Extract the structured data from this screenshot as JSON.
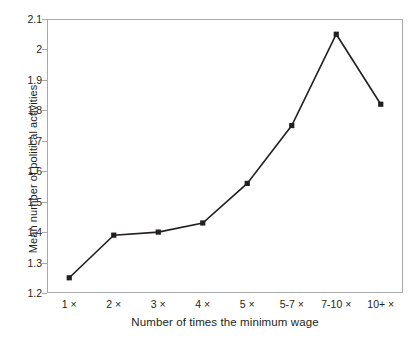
{
  "chart_data": {
    "type": "line",
    "title": "",
    "xlabel": "Number of times the minimum wage",
    "ylabel": "Mean number of political activities",
    "categories": [
      "1 ×",
      "2 ×",
      "3 ×",
      "4 ×",
      "5 ×",
      "5-7 ×",
      "7-10 ×",
      "10+ ×"
    ],
    "values": [
      1.25,
      1.39,
      1.4,
      1.43,
      1.56,
      1.75,
      2.05,
      1.82
    ],
    "ylim": [
      1.2,
      2.1
    ],
    "yticks": [
      1.2,
      1.3,
      1.4,
      1.5,
      1.6,
      1.7,
      1.8,
      1.9,
      2.0,
      2.1
    ],
    "ytick_labels": [
      "1.2",
      "1.3",
      "1.4",
      "1.5",
      "1.6",
      "1.7",
      "1.8",
      "1.9",
      "2",
      "2.1"
    ],
    "grid": false,
    "legend": null,
    "marker": "square",
    "line_color": "#231f20",
    "marker_color": "#231f20",
    "frame_color": "#a7a9ac",
    "background": "#ffffff"
  }
}
